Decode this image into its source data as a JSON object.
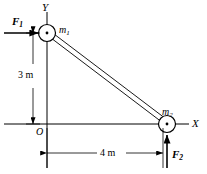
{
  "figure": {
    "type": "mechanics-free-body-diagram",
    "background_color": "#ffffff",
    "line_color": "#000000",
    "axes": {
      "x_label": "X",
      "y_label": "Y",
      "origin_label": "O"
    },
    "masses": [
      {
        "id": "m1",
        "label": "m",
        "subscript": "1",
        "position_label": "top-left"
      },
      {
        "id": "m2",
        "label": "m",
        "subscript": "2",
        "position_label": "bottom-right"
      }
    ],
    "forces": [
      {
        "id": "F1",
        "label": "F",
        "subscript": "1",
        "direction": "right",
        "applied_to": "m1"
      },
      {
        "id": "F2",
        "label": "F",
        "subscript": "2",
        "direction": "up",
        "applied_to": "m2"
      }
    ],
    "dimensions": [
      {
        "id": "vertical-dimension",
        "value": "3 m",
        "orientation": "vertical"
      },
      {
        "id": "horizontal-dimension",
        "value": "4 m",
        "orientation": "horizontal"
      }
    ],
    "rod": {
      "from": "m1",
      "to": "m2",
      "style": "double-line"
    }
  }
}
